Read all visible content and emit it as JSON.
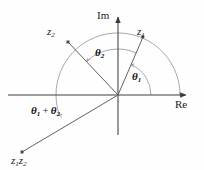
{
  "figure": {
    "background": "#fefefe",
    "line_color": "#555555",
    "arc_color": "#8a8a8a",
    "text_color": "#222222",
    "width": 204,
    "height": 170
  },
  "axes": {
    "imaginary_label": "Im",
    "real_label": "Re",
    "origin": {
      "x": 118,
      "y": 95
    },
    "im_tip": {
      "x": 118,
      "y": 13
    },
    "re_tip": {
      "x": 190,
      "y": 95
    },
    "re_left": {
      "x": 8,
      "y": 95
    },
    "im_bottom": {
      "x": 118,
      "y": 135
    }
  },
  "vectors": [
    {
      "name": "z1",
      "label": "z",
      "subscript": "1",
      "tip": {
        "x": 143,
        "y": 37
      },
      "angle_deg": 66,
      "marker": true
    },
    {
      "name": "z2",
      "label": "z",
      "subscript": "2",
      "tip": {
        "x": 68,
        "y": 42
      },
      "angle_deg": 133,
      "marker": true
    },
    {
      "name": "z1z2",
      "label": "z",
      "subscript": "1",
      "label2": "z",
      "subscript2": "2",
      "tip": {
        "x": 22,
        "y": 152
      },
      "angle_deg": 199,
      "marker": true
    }
  ],
  "angles": [
    {
      "name": "theta1",
      "label": "θ",
      "subscript": "1",
      "value_deg": 66,
      "start_deg": 0,
      "radius": 33,
      "description": "angle of z1 from real axis"
    },
    {
      "name": "theta2",
      "label": "θ",
      "subscript": "2",
      "value_deg": 67,
      "start_deg": 66,
      "radius": 46,
      "description": "angle from z1 to z2"
    },
    {
      "name": "theta-sum",
      "label": "θ",
      "subscript": "1",
      "operator": "+",
      "label2": "θ",
      "subscript2": "2",
      "value_deg": 199,
      "start_deg": 0,
      "radius": 62,
      "description": "total angle of product z1z2"
    }
  ]
}
